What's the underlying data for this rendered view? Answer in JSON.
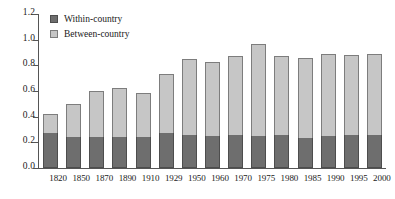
{
  "chart_data": {
    "type": "bar",
    "title": "",
    "xlabel": "",
    "ylabel": "",
    "stacked": true,
    "grid": false,
    "legend_position": "top-left",
    "ylim": [
      0.0,
      1.2
    ],
    "yticks": [
      "0.0",
      "0.2",
      "0.4",
      "0.6",
      "0.8",
      "1.0",
      "1.2"
    ],
    "ytick_values": [
      0.0,
      0.2,
      0.4,
      0.6,
      0.8,
      1.0,
      1.2
    ],
    "categories": [
      "1820",
      "1850",
      "1870",
      "1890",
      "1910",
      "1929",
      "1950",
      "1960",
      "1970",
      "1975",
      "1980",
      "1985",
      "1990",
      "1995",
      "2000"
    ],
    "series": [
      {
        "name": "Within-country",
        "color": "#6e6e6e",
        "values": [
          0.27,
          0.245,
          0.245,
          0.245,
          0.245,
          0.275,
          0.255,
          0.25,
          0.255,
          0.25,
          0.255,
          0.235,
          0.25,
          0.26,
          0.26
        ]
      },
      {
        "name": "Between-country",
        "color": "#c6c6c6",
        "values": [
          0.15,
          0.25,
          0.355,
          0.38,
          0.34,
          0.46,
          0.595,
          0.58,
          0.615,
          0.715,
          0.615,
          0.625,
          0.635,
          0.62,
          0.625
        ]
      }
    ],
    "totals": [
      0.42,
      0.495,
      0.6,
      0.625,
      0.585,
      0.735,
      0.85,
      0.83,
      0.87,
      0.965,
      0.87,
      0.86,
      0.885,
      0.88,
      0.885
    ]
  },
  "legend": {
    "items": [
      {
        "label": "Within-country",
        "color": "#6e6e6e"
      },
      {
        "label": "Between-country",
        "color": "#c6c6c6"
      }
    ]
  }
}
